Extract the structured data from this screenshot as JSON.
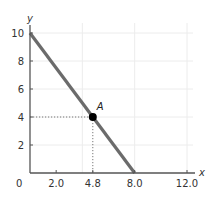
{
  "chart_data": {
    "type": "line",
    "title": "",
    "xlabel": "x",
    "ylabel": "y",
    "xlim": [
      0,
      12.0
    ],
    "ylim": [
      0,
      10
    ],
    "x_ticks": [
      2.0,
      4.8,
      8.0,
      12.0
    ],
    "x_tick_labels": [
      "2.0",
      "4.8",
      "8.0",
      "12.0"
    ],
    "y_ticks": [
      2,
      4,
      6,
      8,
      10
    ],
    "y_tick_labels": [
      "2",
      "4",
      "6",
      "8",
      "10"
    ],
    "origin_label": "0",
    "grid": true,
    "grid_x": [
      4,
      8,
      12
    ],
    "grid_y": [
      2,
      4,
      6,
      8,
      10
    ],
    "series": [
      {
        "name": "line",
        "x": [
          0,
          8.0
        ],
        "y": [
          10,
          0
        ],
        "color": "#6b6b6b"
      }
    ],
    "points": [
      {
        "label": "A",
        "x": 4.8,
        "y": 4,
        "color": "#000000",
        "guides": true
      }
    ]
  }
}
